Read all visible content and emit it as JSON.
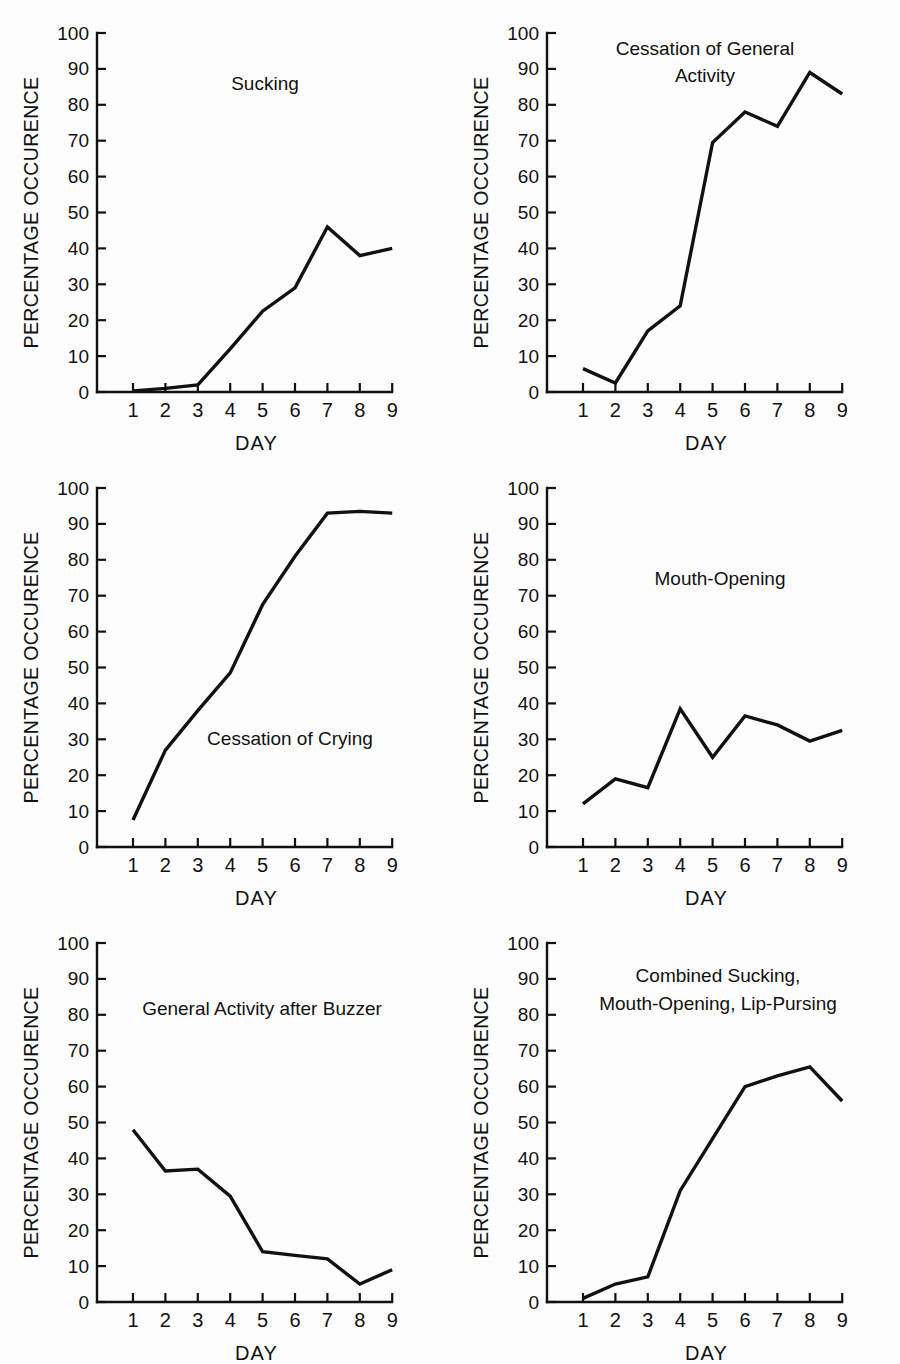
{
  "figure": {
    "background": "#fdfdfd",
    "line_color": "#111111",
    "axis_color": "#111111",
    "panel_count": 6
  },
  "axis": {
    "ylabel": "PERCENTAGE OCCURENCE",
    "xlabel": "DAY",
    "y_ticks": [
      "0",
      "10",
      "20",
      "30",
      "40",
      "50",
      "60",
      "70",
      "80",
      "90",
      "100"
    ],
    "x_ticks": [
      "1",
      "2",
      "3",
      "4",
      "5",
      "6",
      "7",
      "8",
      "9"
    ]
  },
  "chart_data": [
    {
      "type": "line",
      "title": "Sucking",
      "title_lines": [
        "Sucking"
      ],
      "xlabel": "DAY",
      "ylabel": "PERCENTAGE OCCURENCE",
      "x": [
        1,
        2,
        3,
        4,
        5,
        6,
        7,
        8,
        9
      ],
      "values": [
        0.3,
        1.0,
        2.0,
        12.0,
        22.5,
        29.0,
        46.0,
        38.0,
        40.0
      ],
      "xlim": [
        0.6,
        9.2
      ],
      "ylim": [
        0,
        100
      ],
      "grid": false,
      "legend": "none"
    },
    {
      "type": "line",
      "title": "Cessation of General Activity",
      "title_lines": [
        "Cessation of General",
        "Activity"
      ],
      "xlabel": "DAY",
      "ylabel": "PERCENTAGE OCCURENCE",
      "x": [
        1,
        2,
        3,
        4,
        5,
        6,
        7,
        8,
        9
      ],
      "values": [
        6.5,
        2.5,
        17.0,
        24.0,
        69.5,
        78.0,
        74.0,
        89.0,
        83.0
      ],
      "xlim": [
        0.6,
        9.2
      ],
      "ylim": [
        0,
        100
      ],
      "grid": false,
      "legend": "none"
    },
    {
      "type": "line",
      "title": "Cessation of Crying",
      "title_lines": [
        "Cessation of Crying"
      ],
      "xlabel": "DAY",
      "ylabel": "PERCENTAGE OCCURENCE",
      "x": [
        1,
        2,
        3,
        4,
        5,
        6,
        7,
        8,
        9
      ],
      "values": [
        7.5,
        27.0,
        38.0,
        48.5,
        67.5,
        81.0,
        93.0,
        93.5,
        93.0
      ],
      "xlim": [
        0.6,
        9.2
      ],
      "ylim": [
        0,
        100
      ],
      "grid": false,
      "legend": "none"
    },
    {
      "type": "line",
      "title": "Mouth-Opening",
      "title_lines": [
        "Mouth-Opening"
      ],
      "xlabel": "DAY",
      "ylabel": "PERCENTAGE OCCURENCE",
      "x": [
        1,
        2,
        3,
        4,
        5,
        6,
        7,
        8,
        9
      ],
      "values": [
        12.0,
        19.0,
        16.5,
        38.5,
        25.0,
        36.5,
        34.0,
        29.5,
        32.5
      ],
      "xlim": [
        0.6,
        9.2
      ],
      "ylim": [
        0,
        100
      ],
      "grid": false,
      "legend": "none"
    },
    {
      "type": "line",
      "title": "General Activity after Buzzer",
      "title_lines": [
        "General Activity after Buzzer"
      ],
      "xlabel": "DAY",
      "ylabel": "PERCENTAGE OCCURENCE",
      "x": [
        1,
        2,
        3,
        4,
        5,
        6,
        7,
        8,
        9
      ],
      "values": [
        48.0,
        36.5,
        37.0,
        29.5,
        14.0,
        13.0,
        12.0,
        5.0,
        9.0
      ],
      "xlim": [
        0.6,
        9.2
      ],
      "ylim": [
        0,
        100
      ],
      "grid": false,
      "legend": "none"
    },
    {
      "type": "line",
      "title": "Combined Sucking, Mouth-Opening, Lip-Pursing",
      "title_lines": [
        "Combined Sucking,",
        "Mouth-Opening, Lip-Pursing"
      ],
      "xlabel": "DAY",
      "ylabel": "PERCENTAGE OCCURENCE",
      "x": [
        1,
        2,
        3,
        4,
        5,
        6,
        7,
        8,
        9
      ],
      "values": [
        1.0,
        5.0,
        7.0,
        31.0,
        45.5,
        60.0,
        63.0,
        65.5,
        56.0
      ],
      "xlim": [
        0.6,
        9.2
      ],
      "ylim": [
        0,
        100
      ],
      "grid": false,
      "legend": "none"
    }
  ],
  "panels": [
    {
      "index": 0,
      "row": 0,
      "col": 0,
      "title_x": 265,
      "title_y": 90,
      "title_line_height": 25
    },
    {
      "index": 1,
      "row": 0,
      "col": 1,
      "title_x": 255,
      "title_y": 55,
      "title_line_height": 27
    },
    {
      "index": 2,
      "row": 1,
      "col": 0,
      "title_x": 290,
      "title_y": 290,
      "title_line_height": 25
    },
    {
      "index": 3,
      "row": 1,
      "col": 1,
      "title_x": 270,
      "title_y": 130,
      "title_line_height": 25
    },
    {
      "index": 4,
      "row": 2,
      "col": 0,
      "title_x": 262,
      "title_y": 105,
      "title_line_height": 25
    },
    {
      "index": 5,
      "row": 2,
      "col": 1,
      "title_x": 268,
      "title_y": 72,
      "title_line_height": 28
    }
  ]
}
